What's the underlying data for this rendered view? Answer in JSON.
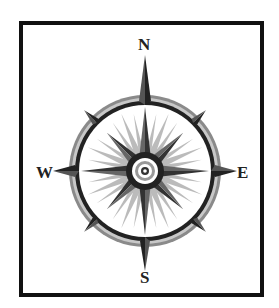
{
  "compass": {
    "labels": {
      "north": "N",
      "east": "E",
      "south": "S",
      "west": "W"
    },
    "colors": {
      "frame": "#111111",
      "dark": "#333333",
      "mid": "#777777",
      "light": "#bbbbbb",
      "background": "#ffffff"
    }
  }
}
